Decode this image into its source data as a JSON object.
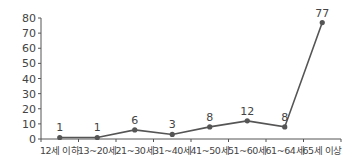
{
  "chart_data": {
    "type": "line",
    "title": "",
    "xlabel": "",
    "ylabel": "",
    "categories": [
      "12세 이하",
      "13~20세",
      "21~30세",
      "31~40세",
      "41~50세",
      "51~60세",
      "61~64세",
      "65세 이상"
    ],
    "series": [
      {
        "name": "",
        "values": [
          1,
          1,
          6,
          3,
          8,
          12,
          8,
          77
        ]
      }
    ],
    "data_labels": [
      "1",
      "1",
      "6",
      "3",
      "8",
      "12",
      "8",
      "77"
    ],
    "ylim": [
      0,
      80
    ],
    "yticks": [
      0,
      10,
      20,
      30,
      40,
      50,
      60,
      70,
      80
    ],
    "ytick_labels": [
      "0",
      "10",
      "20",
      "30",
      "40",
      "50",
      "60",
      "70",
      "80"
    ],
    "grid": false,
    "legend": "none",
    "colors": {
      "line": "#555555",
      "text": "#444444"
    }
  }
}
